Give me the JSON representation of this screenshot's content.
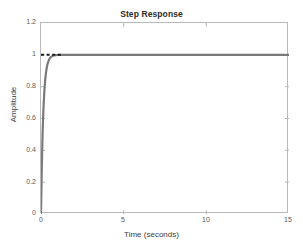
{
  "chart_data": {
    "type": "line",
    "title": "Step Response",
    "xlabel": "Time (seconds)",
    "ylabel": "Amplitude",
    "xlim": [
      0,
      15
    ],
    "ylim": [
      0,
      1.2
    ],
    "xticks": [
      "0",
      "5",
      "10",
      "15"
    ],
    "xtick_values": [
      0,
      5,
      10,
      15
    ],
    "yticks": [
      "0",
      "0.2",
      "0.4",
      "0.6",
      "0.8",
      "1",
      "1.2"
    ],
    "ytick_values": [
      0,
      0.2,
      0.4,
      0.6,
      0.8,
      1,
      1.2
    ],
    "grid": false,
    "legend": null,
    "series": [
      {
        "name": "step response",
        "color": "#7a7a7a",
        "linewidth": 2.2,
        "style": "solid",
        "x": [
          0,
          0.05,
          0.1,
          0.15,
          0.2,
          0.25,
          0.3,
          0.35,
          0.4,
          0.5,
          0.6,
          0.7,
          0.8,
          0.9,
          1.0,
          1.2,
          1.5,
          2.0,
          2.5,
          3.0,
          4.0,
          5.0,
          6.0,
          7.0,
          8.0,
          9.0,
          10.0,
          11.0,
          12.0,
          13.0,
          14.0,
          15.0
        ],
        "y": [
          0,
          0.305,
          0.517,
          0.665,
          0.767,
          0.838,
          0.887,
          0.921,
          0.945,
          0.973,
          0.987,
          0.993,
          0.997,
          0.998,
          0.999,
          1.0,
          1.0,
          1.0,
          1.0,
          1.0,
          1.0,
          1.0,
          1.0,
          1.0,
          1.0,
          1.0,
          1.0,
          1.0,
          1.0,
          1.0,
          1.0,
          1.0
        ]
      },
      {
        "name": "reference-dashed",
        "color": "#1a1a1a",
        "linewidth": 2.0,
        "style": "dashed",
        "x": [
          0,
          1.2
        ],
        "y": [
          1.0,
          1.0
        ]
      }
    ],
    "annotations": [
      {
        "text": "steady-state value 1",
        "x": 0.6,
        "y": 1.0
      }
    ]
  },
  "axes": {
    "box_color": "#b9b9b9",
    "tick_color": "#5a5a5a",
    "background": "#ffffff"
  }
}
